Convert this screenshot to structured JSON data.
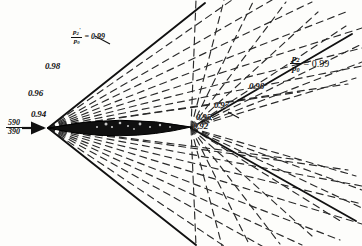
{
  "figure": {
    "kind": "supersonic-flow-pressure-contours",
    "background_color": "#fdfdfb",
    "ink_color": "#111111"
  },
  "labels": {
    "inlet": {
      "numerator": "590",
      "denominator": "390"
    },
    "ratio_left": {
      "numerator": "p",
      "numerator_sub": "2",
      "numerator_prime": "'",
      "denominator": "p",
      "denominator_sub": "0",
      "equals": "= 0.99"
    },
    "ratio_right": {
      "numerator": "p",
      "numerator_sub": "2",
      "denominator": "p",
      "denominator_sub": "0",
      "equals": "= 0.99"
    },
    "contours": [
      {
        "name": "contour-0-98-upper",
        "value": "0.98",
        "x": 45,
        "y": 62
      },
      {
        "name": "contour-0-96-upper",
        "value": "0.96",
        "x": 28,
        "y": 89
      },
      {
        "name": "contour-0-94-upper",
        "value": "0.94",
        "x": 31,
        "y": 110
      },
      {
        "name": "contour-0-98-right",
        "value": "0.98",
        "x": 249,
        "y": 82
      },
      {
        "name": "contour-0-97-right",
        "value": "0.97",
        "x": 214,
        "y": 101
      },
      {
        "name": "contour-0-95-right",
        "value": "0.95",
        "x": 196,
        "y": 113
      },
      {
        "name": "contour-0-92-right",
        "value": "0.92",
        "x": 193,
        "y": 122
      }
    ]
  },
  "chart_data": {
    "type": "line",
    "title": "",
    "xlabel": "",
    "ylabel": "",
    "grid": false,
    "legend": "none",
    "xlim": [
      0,
      362
    ],
    "ylim": [
      0,
      246
    ],
    "annotations": [
      "p2'/p0 = 0.99",
      "p2/p0 = 0.99",
      "0.98",
      "0.96",
      "0.94",
      "0.97",
      "0.95",
      "0.92",
      "590/390"
    ],
    "geometry": {
      "leading_edge": [
        48,
        128
      ],
      "trailing_edge": [
        191,
        128
      ],
      "chord_axis_y": 128,
      "body_max_thickness": 13,
      "freestream_arrow": [
        [
          22,
          128
        ],
        [
          46,
          128
        ]
      ]
    },
    "series": [
      {
        "name": "upper-mach-boundary",
        "kind": "solid",
        "points": [
          [
            48,
            128
          ],
          [
            120,
            71
          ],
          [
            175,
            27
          ],
          [
            205,
            3
          ]
        ]
      },
      {
        "name": "lower-mach-boundary",
        "kind": "solid",
        "points": [
          [
            48,
            128
          ],
          [
            118,
            186
          ],
          [
            168,
            226
          ],
          [
            196,
            245
          ]
        ]
      },
      {
        "name": "upper-trailing-boundary",
        "kind": "solid",
        "points": [
          [
            191,
            128
          ],
          [
            250,
            94
          ],
          [
            300,
            66
          ],
          [
            348,
            38
          ]
        ]
      },
      {
        "name": "lower-trailing-boundary",
        "kind": "solid",
        "points": [
          [
            191,
            128
          ],
          [
            248,
            160
          ],
          [
            300,
            189
          ],
          [
            352,
            218
          ]
        ]
      }
    ],
    "fans": [
      {
        "name": "leading-edge-upper-fan",
        "style": "dashed",
        "origin": [
          48,
          128
        ],
        "ray_count": 9
      },
      {
        "name": "leading-edge-lower-fan",
        "style": "dashed",
        "origin": [
          48,
          128
        ],
        "ray_count": 9
      },
      {
        "name": "trailing-edge-upper-fan",
        "style": "dashed",
        "origin": [
          191,
          128
        ],
        "ray_count": 9
      },
      {
        "name": "trailing-edge-lower-fan",
        "style": "dashed",
        "origin": [
          191,
          128
        ],
        "ray_count": 9
      }
    ]
  }
}
